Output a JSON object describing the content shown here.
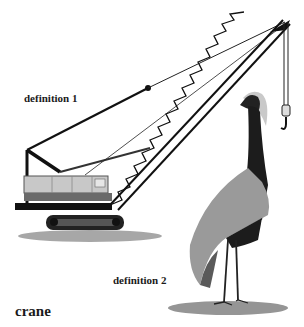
{
  "labels": {
    "definition1": "definition 1",
    "definition2": "definition 2",
    "word": "crane"
  },
  "illustrations": [
    {
      "name": "construction-crane",
      "caption_ref": "definition 1"
    },
    {
      "name": "crane-bird",
      "caption_ref": "definition 2"
    }
  ],
  "colors": {
    "background": "#ffffff",
    "ink": "#1a1a1a",
    "cab_light": "#c8c8c8",
    "cab_dark": "#6a6a6a",
    "shadow": "#8a8a8a",
    "bird_body": "#1c1c1c",
    "bird_wing": "#9a9a9a"
  }
}
